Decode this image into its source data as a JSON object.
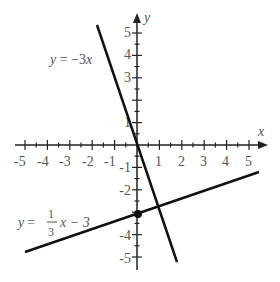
{
  "figure": {
    "axes": {
      "x_label": "x",
      "y_label": "y",
      "x_ticks": [
        "-5",
        "-4",
        "-3",
        "-2",
        "-1",
        "1",
        "2",
        "3",
        "4",
        "5"
      ],
      "y_ticks": [
        "5",
        "4",
        "3",
        "1",
        "-1",
        "-2",
        "-4",
        "-5"
      ],
      "range": [
        -5,
        5
      ]
    },
    "lines": [
      {
        "equation": "y = −3x",
        "label_y": "y",
        "label_eq": " = −3",
        "label_x": "x",
        "slope": -3,
        "intercept": 0
      },
      {
        "equation": "y = (1/3)x − 3",
        "label_y": "y",
        "label_eq": " = ",
        "frac_num": "1",
        "frac_den": "3",
        "label_rest": "x − 3",
        "slope": 0.3333,
        "intercept": -3
      }
    ],
    "point": {
      "x": 0,
      "y": -3
    }
  }
}
